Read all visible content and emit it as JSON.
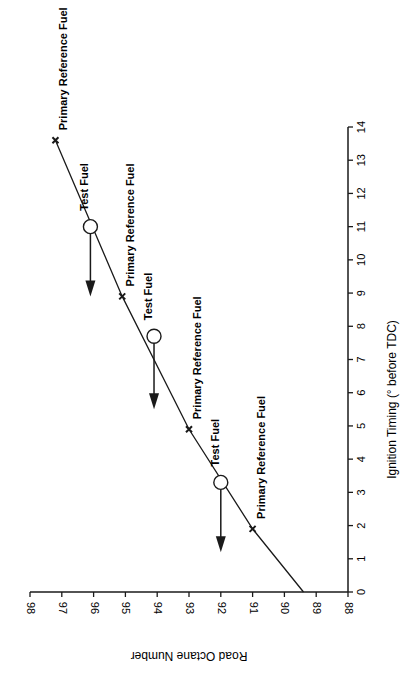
{
  "chart_data": {
    "type": "line",
    "orientation": "rotated-90-ccw",
    "title": "",
    "xlabel": "Ignition Timing (° before TDC)",
    "ylabel": "Road Octane Number",
    "xlim": [
      0,
      14
    ],
    "ylim": [
      88,
      98
    ],
    "x_ticks": [
      "0",
      "1",
      "2",
      "3",
      "4",
      "5",
      "6",
      "7",
      "8",
      "9",
      "10",
      "11",
      "12",
      "13",
      "14"
    ],
    "y_ticks": [
      "88",
      "89",
      "90",
      "91",
      "92",
      "93",
      "94",
      "95",
      "96",
      "97",
      "98"
    ],
    "grid": false,
    "series": [
      {
        "name": "Primary Reference Fuel curve",
        "marker": "x",
        "points": [
          {
            "x": 0.0,
            "y": 89.4
          },
          {
            "x": 1.9,
            "y": 91.0,
            "label": "Primary Reference Fuel"
          },
          {
            "x": 4.9,
            "y": 93.0,
            "label": "Primary Reference Fuel"
          },
          {
            "x": 8.9,
            "y": 95.1,
            "label": "Primary Reference Fuel"
          },
          {
            "x": 13.6,
            "y": 97.2,
            "label": "Primary Reference Fuel"
          }
        ]
      },
      {
        "name": "Test Fuel",
        "marker": "open-circle",
        "points": [
          {
            "x": 3.3,
            "y": 92.0,
            "label": "Test Fuel",
            "arrow_to_ignition": 1.2
          },
          {
            "x": 7.7,
            "y": 94.1,
            "label": "Test Fuel",
            "arrow_to_ignition": 5.5
          },
          {
            "x": 11.0,
            "y": 96.1,
            "label": "Test Fuel",
            "arrow_to_ignition": 8.9
          }
        ]
      }
    ],
    "annotations": [
      "Primary Reference Fuel",
      "Test Fuel"
    ]
  },
  "labels": {
    "ron_axis_title": "Road Octane Number",
    "ign_axis_title": "Ignition Timing (° before TDC)",
    "prf": "Primary Reference Fuel",
    "test": "Test Fuel"
  }
}
